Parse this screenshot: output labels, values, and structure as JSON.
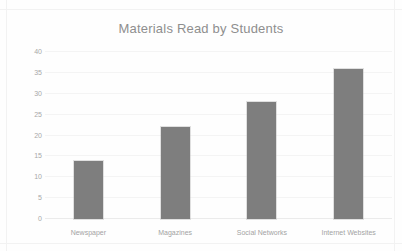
{
  "chart_data": {
    "type": "bar",
    "title": "Materials Read by Students",
    "xlabel": "",
    "ylabel": "",
    "categories": [
      "Newspaper",
      "Magazines",
      "Social Networks",
      "Internet Websites"
    ],
    "values": [
      14,
      22,
      28,
      36
    ],
    "ylim": [
      0,
      40
    ],
    "yticks": [
      0,
      5,
      10,
      15,
      20,
      25,
      30,
      35,
      40
    ],
    "ytick_labels": [
      "0",
      "5",
      "10",
      "15",
      "20",
      "25",
      "30",
      "35",
      "40"
    ],
    "grid": true,
    "legend": false,
    "series": [
      {
        "name": "Students",
        "values": [
          14,
          22,
          28,
          36
        ],
        "color": "#7e7e7e"
      }
    ]
  },
  "colors": {
    "bar": "#7e7e7e",
    "title_text": "#8e8e8e",
    "tick_text": "#a8a8a8",
    "category_text": "#a3a3a3",
    "gridline": "#f4f4f4",
    "background": "#fefefe"
  }
}
